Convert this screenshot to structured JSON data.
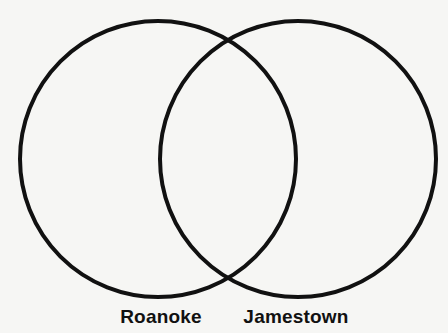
{
  "diagram": {
    "type": "venn",
    "stroke_color": "#111111",
    "background": "#f6f6f4",
    "sets": [
      {
        "name": "Roanoke",
        "cx": 158,
        "cy": 159,
        "r": 138,
        "label_x": 161
      },
      {
        "name": "Jamestown",
        "cx": 298,
        "cy": 159,
        "r": 138,
        "label_x": 296
      }
    ]
  }
}
